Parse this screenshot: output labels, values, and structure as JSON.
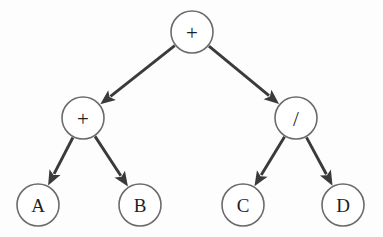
{
  "diagram": {
    "background_color": "#fdfdfd",
    "node_stroke_color": "#6b6b6b",
    "node_fill_color": "#ffffff",
    "edge_color": "#3a3a3a",
    "label_color": "#1f1f1f",
    "node_radius": 21,
    "nodes": [
      {
        "id": "root",
        "label": "+",
        "kind": "operator",
        "cx": 192,
        "cy": 32,
        "r": 21
      },
      {
        "id": "left",
        "label": "+",
        "kind": "operator",
        "cx": 83,
        "cy": 118,
        "r": 21
      },
      {
        "id": "right",
        "label": "/",
        "kind": "operator",
        "cx": 296,
        "cy": 118,
        "r": 21
      },
      {
        "id": "a",
        "label": "A",
        "kind": "operand",
        "cx": 38,
        "cy": 205,
        "r": 21
      },
      {
        "id": "b",
        "label": "B",
        "kind": "operand",
        "cx": 140,
        "cy": 205,
        "r": 21
      },
      {
        "id": "c",
        "label": "C",
        "kind": "operand",
        "cx": 243,
        "cy": 205,
        "r": 21
      },
      {
        "id": "d",
        "label": "D",
        "kind": "operand",
        "cx": 343,
        "cy": 205,
        "r": 21
      }
    ],
    "edges": [
      {
        "id": "root-left",
        "from": "root",
        "to": "left",
        "directed": true
      },
      {
        "id": "root-right",
        "from": "root",
        "to": "right",
        "directed": true
      },
      {
        "id": "left-a",
        "from": "left",
        "to": "a",
        "directed": true
      },
      {
        "id": "left-b",
        "from": "left",
        "to": "b",
        "directed": true
      },
      {
        "id": "right-c",
        "from": "right",
        "to": "c",
        "directed": true
      },
      {
        "id": "right-d",
        "from": "right",
        "to": "d",
        "directed": true
      }
    ]
  }
}
